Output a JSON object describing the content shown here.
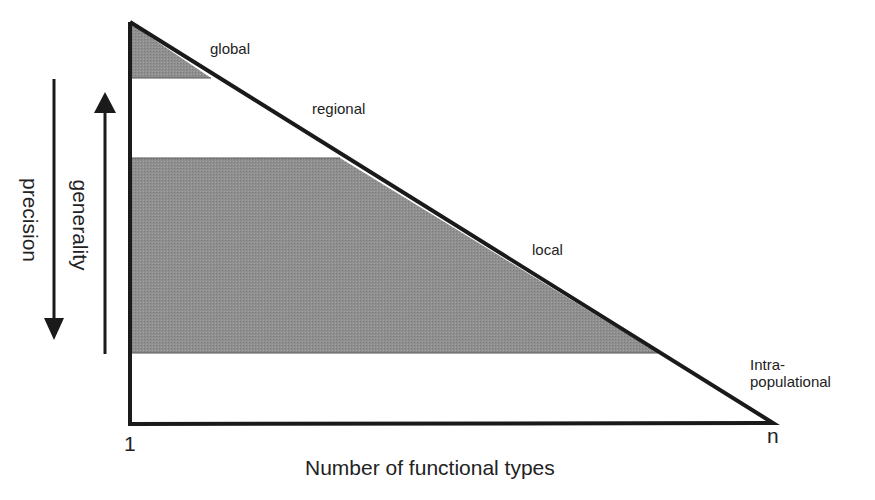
{
  "diagram": {
    "type": "triangle-scale-diagram",
    "x_axis": {
      "title": "Number of functional types",
      "start_label": "1",
      "end_label": "n"
    },
    "left_arrows": [
      {
        "label": "precision",
        "direction": "down"
      },
      {
        "label": "generality",
        "direction": "up"
      }
    ],
    "scales": [
      {
        "label": "global",
        "shaded": true
      },
      {
        "label": "regional",
        "shaded": false
      },
      {
        "label": "local",
        "shaded": true
      },
      {
        "label_line1": "Intra-",
        "label_line2": "populational",
        "shaded": false
      }
    ],
    "colors": {
      "shade": "#8c8c8c",
      "line": "#1a1a1a",
      "background": "#ffffff"
    }
  }
}
